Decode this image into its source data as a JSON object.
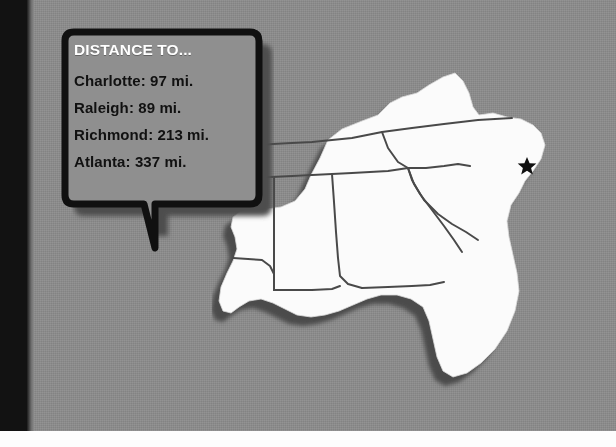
{
  "page": {
    "background_color": "#8b8b8b",
    "left_band_color": "#121212",
    "bottom_strip_color": "#fdfdfd"
  },
  "callout": {
    "name": "distance-callout",
    "title": "DISTANCE TO...",
    "title_color": "#ffffff",
    "text_color": "#111111",
    "border_color": "#101010",
    "fill_color": "#8f8f8f",
    "distances": [
      {
        "city": "Charlotte",
        "value": "97",
        "unit": "mi.",
        "text": "Charlotte: 97 mi."
      },
      {
        "city": "Raleigh",
        "value": "89",
        "unit": "mi.",
        "text": "Raleigh: 89 mi."
      },
      {
        "city": "Richmond",
        "value": "213",
        "unit": "mi.",
        "text": "Richmond: 213 mi."
      },
      {
        "city": "Atlanta",
        "value": "337",
        "unit": "mi.",
        "text": "Atlanta: 337 mi."
      }
    ]
  },
  "map": {
    "name": "southeast-us-map",
    "region": "Southeastern United States",
    "land_color": "#fbfbfb",
    "border_color": "#4a4a4a",
    "shadow_color": "#4f4f4f",
    "marker": {
      "name": "location-star-marker",
      "glyph": "star",
      "color": "#101010",
      "state": "North Carolina"
    },
    "states": [
      "Kentucky",
      "Virginia",
      "Tennessee",
      "North Carolina",
      "South Carolina",
      "Georgia",
      "Alabama",
      "Mississippi",
      "Louisiana",
      "Florida"
    ]
  }
}
